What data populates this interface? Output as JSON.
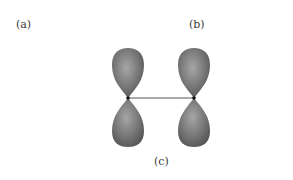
{
  "labels": {
    "a": "(a)",
    "b": "(b)",
    "c": "(c)"
  },
  "diagram": {
    "orbital_color": "#6e6e6e",
    "highlight_color": "#a8a8a8",
    "nucleus_color": "#111111",
    "bond_color": "#555555"
  }
}
